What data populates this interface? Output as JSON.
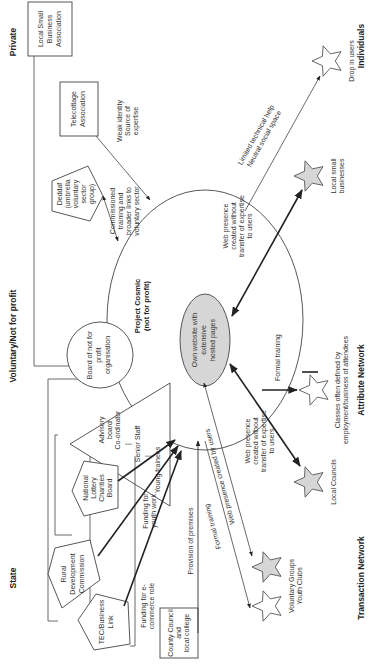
{
  "column_headers": {
    "state": "State",
    "voluntary": "Voluntary/Not for profit",
    "private": "Private"
  },
  "network_labels": {
    "transaction": "Transaction Network",
    "attribute": "Attribute Network",
    "individuals": "Individuals"
  },
  "hub": {
    "title_line1": "Project Cosmic",
    "title_line2": "(not for profit)",
    "inner_line1": "Own website with",
    "inner_line2": "extensive",
    "inner_line3": "hosted pages"
  },
  "nodes": {
    "local_small_business_assoc": [
      "Local Small",
      "Business",
      "Association"
    ],
    "telecottage_assoc": [
      "Telecottage",
      "Association"
    ],
    "deddaf": [
      "Deddaf",
      "(umbrella",
      "voluntary",
      "sector",
      "group)"
    ],
    "board": [
      "Board of not for",
      "profit",
      "organisation"
    ],
    "advisory": [
      "Advisory",
      "board",
      "Co-ordinator",
      "|",
      "Senior Staff",
      "|",
      "Young trainees"
    ],
    "national_lottery": [
      "National",
      "Lottery",
      "Charities",
      "Board"
    ],
    "rural_dev": [
      "Rural",
      "Development",
      "Commission"
    ],
    "tec": [
      "TEC/Business",
      "Link"
    ],
    "county_council": [
      "County Council",
      "and",
      "local college"
    ]
  },
  "edge_labels": {
    "weak_identity": [
      "Weak identity",
      "Source of",
      "expertise"
    ],
    "commissioned": [
      "Commissioned",
      "training and",
      "broader links to",
      "voluntary sector"
    ],
    "limited_help": [
      "Limited technical help",
      "Neutral social space"
    ],
    "web_presence_small_biz": [
      "Web presence",
      "created without",
      "transfer of expertise",
      "to users"
    ],
    "formal_training_classes": "Formal training",
    "web_presence_councils": [
      "Web presence",
      "created without",
      "transfer of expertise",
      "to users"
    ],
    "funding_youth": [
      "Funding for",
      "youth work"
    ],
    "funding_ecommerce": [
      "Funding for e-",
      "commerce role"
    ],
    "provision_premises": "Provision of premises",
    "formal_training_bottom": "Formal training",
    "web_presence_users": "Web presence created by users"
  },
  "stars": {
    "drop_in": "Drop in users",
    "local_small_biz": [
      "Local small",
      "businesses"
    ],
    "classes": [
      "Classes often defined by",
      "employment/business of attendees"
    ],
    "local_councils": "Local Councils",
    "voluntary_groups": [
      "Voluntary Groups",
      "Youth Clubs"
    ]
  },
  "colors": {
    "line": "#444444",
    "grey_fill": "#d6d6d6",
    "background": "#ffffff"
  }
}
